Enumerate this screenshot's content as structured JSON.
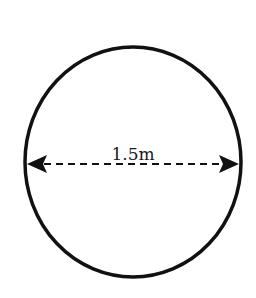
{
  "diagram": {
    "shape": "circle",
    "dimension": {
      "type": "diameter",
      "label": "1.5m",
      "line_style": "dashed",
      "arrows": "both-ends"
    },
    "colors": {
      "stroke": "#111111",
      "background": "#ffffff"
    }
  }
}
